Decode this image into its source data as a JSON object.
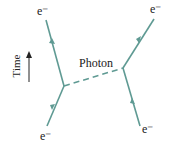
{
  "diagram": {
    "type": "feynman",
    "labels": {
      "top_left": "e⁻",
      "bottom_left": "e⁻",
      "top_right": "e⁻",
      "bottom_right": "e⁻",
      "photon": "Photon",
      "time_axis": "Time"
    },
    "colors": {
      "fermion_line": "#5f9a93",
      "text": "#222222"
    }
  }
}
